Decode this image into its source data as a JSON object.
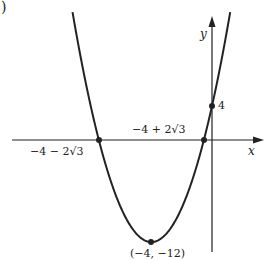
{
  "figure": {
    "part_marker": ")",
    "x_axis_label": "x",
    "y_axis_label": "y",
    "y_intercept_label": "4",
    "left_root_label": "−4 − 2√3",
    "right_root_label": "−4 + 2√3",
    "vertex_label": "(−4, −12)"
  },
  "chart_data": {
    "type": "line",
    "title": "",
    "function": "y = x^2 + 8x + 4",
    "xlabel": "x",
    "ylabel": "y",
    "grid": false,
    "legend": null,
    "key_points": [
      {
        "name": "left root",
        "x": -7.464,
        "y": 0,
        "label": "−4 − 2√3"
      },
      {
        "name": "right root",
        "x": -0.536,
        "y": 0,
        "label": "−4 + 2√3"
      },
      {
        "name": "y-intercept",
        "x": 0,
        "y": 4,
        "label": "4"
      },
      {
        "name": "vertex",
        "x": -4,
        "y": -12,
        "label": "(−4, −12)"
      }
    ],
    "x_range_approx": [
      -13.4,
      3.3
    ],
    "y_range_approx": [
      -13,
      14.5
    ]
  }
}
